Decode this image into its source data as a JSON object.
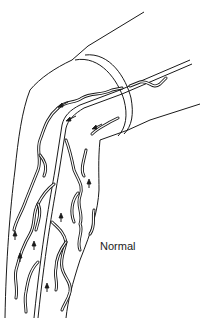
{
  "figure": {
    "label": "Normal",
    "colors": {
      "line": "#1a1a1a",
      "background": "#ffffff"
    },
    "icons": [
      "upward-flow-arrow",
      "downward-flow-arrow"
    ]
  }
}
